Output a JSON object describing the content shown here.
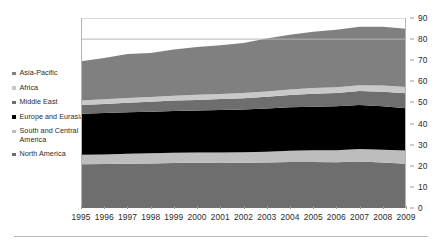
{
  "chart_data": {
    "type": "area",
    "stacked": true,
    "title": "",
    "xlabel": "",
    "ylabel": "",
    "grid": true,
    "legend_position": "left",
    "ylim": [
      0,
      90
    ],
    "yticks": [
      0,
      10,
      20,
      30,
      40,
      50,
      60,
      70,
      80,
      90
    ],
    "categories": [
      "1995",
      "1996",
      "1997",
      "1998",
      "1999",
      "2000",
      "2001",
      "2002",
      "2003",
      "2004",
      "2005",
      "2006",
      "2007",
      "2008",
      "2009"
    ],
    "series": [
      {
        "name": "North America",
        "color": "#6e6e6e",
        "values": [
          20.7,
          20.8,
          21.0,
          21.1,
          21.3,
          21.4,
          21.3,
          21.4,
          21.6,
          21.8,
          21.8,
          21.7,
          22.0,
          21.5,
          21.0
        ]
      },
      {
        "name": "South and Central America",
        "color": "#bdbdbd",
        "values": [
          4.5,
          4.6,
          4.7,
          4.8,
          4.9,
          4.9,
          5.0,
          5.0,
          5.1,
          5.3,
          5.5,
          5.7,
          6.0,
          6.1,
          6.2
        ]
      },
      {
        "name": "Europe and Eurasia",
        "color": "#000000",
        "values": [
          19.5,
          19.6,
          19.7,
          19.7,
          19.8,
          19.9,
          20.1,
          20.2,
          20.4,
          20.6,
          20.7,
          20.8,
          20.8,
          20.6,
          20.1
        ]
      },
      {
        "name": "Middle East",
        "color": "#6e6e6e",
        "values": [
          4.1,
          4.3,
          4.5,
          4.7,
          4.9,
          5.0,
          5.2,
          5.4,
          5.6,
          5.8,
          6.1,
          6.3,
          6.6,
          6.9,
          7.1
        ]
      },
      {
        "name": "Africa",
        "color": "#c9c9c9",
        "values": [
          2.1,
          2.2,
          2.2,
          2.3,
          2.3,
          2.4,
          2.4,
          2.5,
          2.5,
          2.6,
          2.7,
          2.7,
          2.8,
          2.9,
          2.9
        ]
      },
      {
        "name": "Asia-Pacific",
        "color": "#808080",
        "values": [
          18.6,
          19.6,
          20.8,
          20.8,
          21.9,
          22.7,
          23.1,
          23.6,
          25.1,
          26.0,
          26.7,
          27.2,
          27.6,
          27.8,
          27.6
        ]
      }
    ],
    "legend_entries": [
      {
        "label": "Asia-Pacific",
        "color": "#808080"
      },
      {
        "label": "Africa",
        "color": "#c9c9c9"
      },
      {
        "label": "Middle East",
        "color": "#6e6e6e"
      },
      {
        "label": "Europe and Eurasia",
        "color": "#000000"
      },
      {
        "label": "South and Central\nAmerica",
        "color": "#bdbdbd"
      },
      {
        "label": "North America",
        "color": "#6e6e6e"
      }
    ]
  }
}
